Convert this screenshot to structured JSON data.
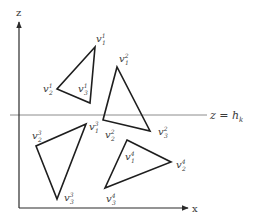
{
  "axes": {
    "z_label": "z",
    "x_label": "x",
    "origin": [
      19,
      208
    ],
    "z_top": [
      19,
      22
    ],
    "x_right": [
      188,
      208
    ]
  },
  "plane": {
    "label": "z = h",
    "label_sub": "k",
    "y": 115,
    "x_start": 10,
    "x_end": 207
  },
  "colors": {
    "stroke": "#1e1e1e",
    "axis": "#2a2a2a",
    "plane": "#8c8c8c",
    "text": "#3a3a3a"
  },
  "triangles": [
    {
      "id": 1,
      "points": [
        [
          95,
          47
        ],
        [
          57,
          89
        ],
        [
          90,
          103
        ]
      ],
      "labels": [
        {
          "base": "v",
          "sub": "1",
          "sup": "1",
          "x": 96,
          "y": 42
        },
        {
          "base": "v",
          "sub": "2",
          "sup": "1",
          "x": 43,
          "y": 92
        },
        {
          "base": "v",
          "sub": "3",
          "sup": "1",
          "x": 78,
          "y": 92
        }
      ]
    },
    {
      "id": 2,
      "points": [
        [
          117,
          67
        ],
        [
          103,
          120
        ],
        [
          150,
          131
        ]
      ],
      "labels": [
        {
          "base": "v",
          "sub": "1",
          "sup": "2",
          "x": 119,
          "y": 62
        },
        {
          "base": "v",
          "sub": "2",
          "sup": "2",
          "x": 105,
          "y": 138
        },
        {
          "base": "v",
          "sub": "3",
          "sup": "2",
          "x": 158,
          "y": 135
        }
      ]
    },
    {
      "id": 3,
      "points": [
        [
          86,
          124
        ],
        [
          36,
          146
        ],
        [
          57,
          199
        ]
      ],
      "labels": [
        {
          "base": "v",
          "sub": "1",
          "sup": "3",
          "x": 89,
          "y": 130
        },
        {
          "base": "v",
          "sub": "2",
          "sup": "3",
          "x": 32,
          "y": 139
        },
        {
          "base": "v",
          "sub": "3",
          "sup": "3",
          "x": 64,
          "y": 201
        }
      ]
    },
    {
      "id": 4,
      "points": [
        [
          127,
          140
        ],
        [
          171,
          162
        ],
        [
          105,
          188
        ]
      ],
      "labels": [
        {
          "base": "v",
          "sub": "1",
          "sup": "4",
          "x": 125,
          "y": 160
        },
        {
          "base": "v",
          "sub": "2",
          "sup": "4",
          "x": 176,
          "y": 168
        },
        {
          "base": "v",
          "sub": "3",
          "sup": "4",
          "x": 106,
          "y": 202
        }
      ]
    }
  ]
}
